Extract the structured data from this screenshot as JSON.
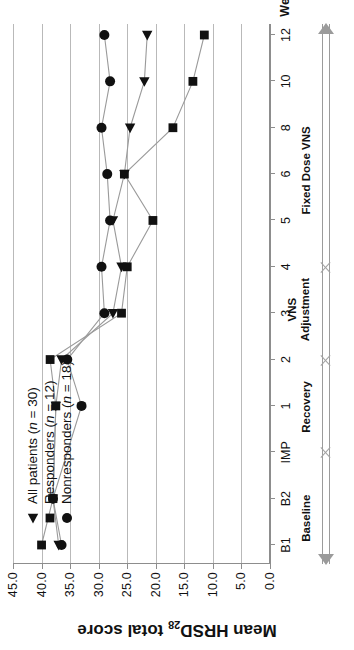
{
  "chart_data": {
    "type": "line",
    "title": "",
    "subtitle": "",
    "xlabel": "Weeks",
    "ylabel": "Mean HRSD28 total score",
    "ylabel_base": "Mean HRSD",
    "ylabel_sub": "28",
    "ylabel_tail": " total score",
    "categories": [
      "B1",
      "B2",
      "IMP",
      "1",
      "2",
      "3",
      "4",
      "5",
      "6",
      "8",
      "10",
      "12"
    ],
    "ylim": [
      0.0,
      45.0
    ],
    "ytick_step": 5.0,
    "yticks": [
      "0.0",
      "5.0",
      "10.0",
      "15.0",
      "20.0",
      "25.0",
      "30.0",
      "35.0",
      "40.0",
      "45.0"
    ],
    "ytick_values": [
      0.0,
      5.0,
      10.0,
      15.0,
      20.0,
      25.0,
      30.0,
      35.0,
      40.0,
      45.0
    ],
    "grid": true,
    "grid_orientation": "horizontal",
    "legend_position": "upper-left-inside",
    "series": [
      {
        "name": "All patients (n = 30)",
        "label_text": "All patients (",
        "label_italic": "n",
        "label_tail": " = 30)",
        "marker": "triangle-left",
        "color": "#111111",
        "values": [
          37.0,
          38.0,
          null,
          37.5,
          36.5,
          27.5,
          26.0,
          27.5,
          25.5,
          24.5,
          22.0,
          21.5
        ]
      },
      {
        "name": "Responders (n = 12)",
        "label_text": "Responders (",
        "label_italic": "n",
        "label_tail": " = 12)",
        "marker": "square",
        "color": "#111111",
        "values": [
          40.0,
          38.0,
          null,
          37.5,
          38.5,
          26.0,
          25.0,
          20.5,
          25.5,
          17.0,
          13.5,
          11.5
        ]
      },
      {
        "name": "Nonresponders (n = 18)",
        "label_text": "Nonresponders (",
        "label_italic": "n",
        "label_tail": " = 18)",
        "marker": "circle",
        "color": "#111111",
        "values": [
          36.5,
          38.0,
          null,
          33.0,
          35.5,
          29.0,
          29.5,
          28.0,
          28.5,
          29.5,
          28.0,
          29.0
        ]
      }
    ],
    "phases": [
      {
        "label": "Baseline",
        "start_category": "B1",
        "end_category": "IMP",
        "center_category_index": 0.6
      },
      {
        "label": "Recovery",
        "start_category": "IMP",
        "end_category": "2",
        "center_category_index": 3.0
      },
      {
        "label": "VNS\nAdjustment",
        "start_category": "2",
        "end_category": "4",
        "center_category_index": 5.1
      },
      {
        "label": "Fixed Dose VNS",
        "start_category": "4",
        "end_category": "12",
        "center_category_index": 8.1
      }
    ],
    "phase_dividers": [
      "IMP",
      "2",
      "4"
    ],
    "phase_divider_indices": [
      2,
      4,
      6
    ],
    "axis_color": "#8d8d8d",
    "grid_color": "#b9b9b9",
    "marker_color": "#111111",
    "line_color": "#9a9a9a"
  }
}
